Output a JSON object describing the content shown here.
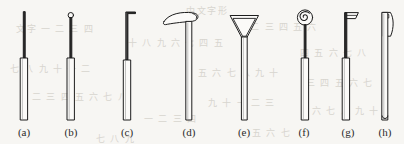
{
  "figure": {
    "background_color": "#f7f6f3",
    "ink_color": "#1d1d1d",
    "fill_color": "#fbfaf8",
    "caption_color": "#2b2b2b",
    "bleed_color": "#d8d5cf",
    "type": "line-drawing-plate"
  },
  "items": [
    {
      "key": "a",
      "label": "(a)",
      "head": "plain-pointed-rod",
      "head_description": "plain thin straight shaft, no head",
      "center_x": 24,
      "caption_left": 7
    },
    {
      "key": "b",
      "label": "(b)",
      "head": "small-ring-knob",
      "head_description": "small open circle / ring knob at tip",
      "center_x": 71,
      "caption_left": 54
    },
    {
      "key": "c",
      "label": "(c)",
      "head": "short-right-angle-hook",
      "head_description": "short horizontal bar bent to the right at the tip",
      "center_x": 127,
      "caption_left": 110
    },
    {
      "key": "d",
      "label": "(d)",
      "head": "long-curved-flat-hook",
      "head_description": "long flat curved blade sweeping to the left with a small curl at the right",
      "center_x": 189,
      "caption_left": 172
    },
    {
      "key": "e",
      "label": "(e)",
      "head": "funnel-triangle",
      "head_description": "inverted triangular funnel head with flat top edge",
      "center_x": 244,
      "caption_left": 227
    },
    {
      "key": "f",
      "label": "(f)",
      "head": "spiral-coil",
      "head_description": "round spiral / coiled disc head",
      "center_x": 304,
      "caption_left": 287
    },
    {
      "key": "g",
      "label": "(g)",
      "head": "small-angled-blade",
      "head_description": "small flat angled blade projecting to the right like a flag",
      "center_x": 348,
      "caption_left": 331
    },
    {
      "key": "h",
      "label": "(h)",
      "head": "curved-scoop-blade",
      "head_description": "tall curved scoop blade attached along the right of the shaft",
      "center_x": 385,
      "caption_left": 368
    }
  ],
  "bleed_text": [
    {
      "text": "中文字形",
      "left": 186,
      "top": 4
    },
    {
      "text": "文字 一 二 三 四",
      "left": 16,
      "top": 22
    },
    {
      "text": "十 八 九 六 七 四 五",
      "left": 128,
      "top": 36
    },
    {
      "text": "一 二 三 四 五 六",
      "left": 236,
      "top": 20
    },
    {
      "text": "四 五 六 七 八",
      "left": 300,
      "top": 46
    },
    {
      "text": "七 八 九 十 一 二",
      "left": 10,
      "top": 62
    },
    {
      "text": "五 六 七 八 九 十",
      "left": 198,
      "top": 66
    },
    {
      "text": "三 四 五 六 七",
      "left": 306,
      "top": 76
    },
    {
      "text": "二 三 四 五 六 七 八",
      "left": 32,
      "top": 90
    },
    {
      "text": "九 十 一 二 三",
      "left": 208,
      "top": 96
    },
    {
      "text": "六 七 八 九 十",
      "left": 312,
      "top": 104
    },
    {
      "text": "一 二 三 四",
      "left": 144,
      "top": 112
    },
    {
      "text": "五 六 七",
      "left": 252,
      "top": 126
    },
    {
      "text": "七 八 九",
      "left": 96,
      "top": 132
    }
  ]
}
